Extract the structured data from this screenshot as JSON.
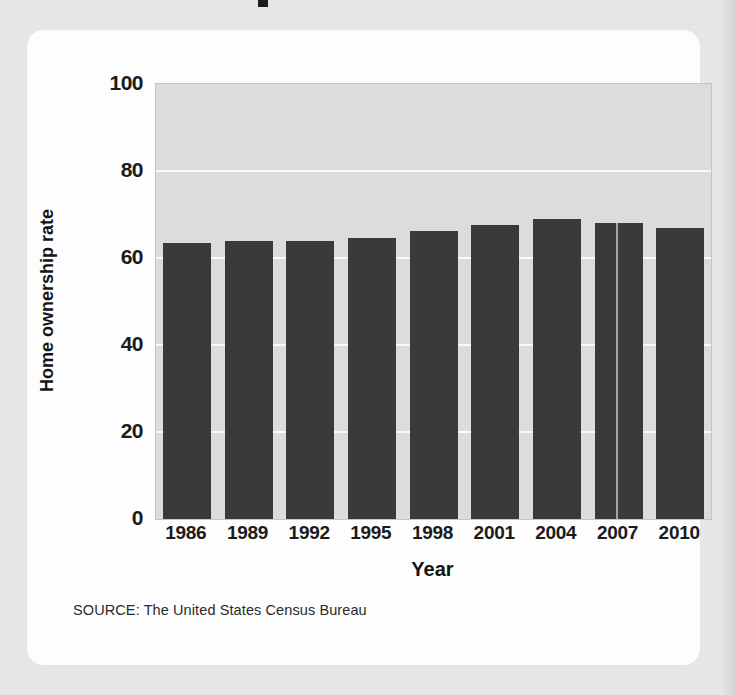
{
  "page": {
    "background_color": "#e9e9e9",
    "card_background_color": "#fdfdfd"
  },
  "source_note": "SOURCE: The United States Census Bureau",
  "chart_data": {
    "type": "bar",
    "title": "",
    "xlabel": "Year",
    "ylabel": "Home ownership rate",
    "categories": [
      "1986",
      "1989",
      "1992",
      "1995",
      "1998",
      "2001",
      "2004",
      "2007",
      "2010"
    ],
    "values": [
      63.5,
      63.8,
      64.0,
      64.5,
      66.2,
      67.6,
      69.0,
      68.1,
      67.0
    ],
    "ylim": [
      0,
      100
    ],
    "yticks": [
      "0",
      "20",
      "40",
      "60",
      "80",
      "100"
    ],
    "ytick_values": [
      0,
      20,
      40,
      60,
      80,
      100
    ],
    "grid": true,
    "grid_color": "#fafafa",
    "legend": "none",
    "bar_color": "#3a3a3a",
    "plot_background_color": "#dcdcdc"
  }
}
